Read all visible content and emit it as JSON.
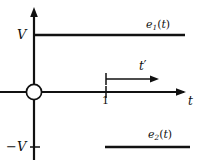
{
  "figure": {
    "background_color": "#ffffff",
    "stroke_color": "#111111",
    "width": 201,
    "height": 164
  },
  "axes": {
    "vertical": {
      "name": "voltage-axis",
      "x": 34,
      "top": 8,
      "bottom": 160,
      "arrow": "up"
    },
    "horizontal": {
      "name": "time-axis",
      "y": 92,
      "left": 0,
      "right": 186,
      "arrow": "right",
      "label": "t"
    },
    "origin": {
      "name": "origin-node",
      "x": 34,
      "y": 92,
      "radius": 8,
      "symbol": "crossed-circle"
    }
  },
  "ticks": [
    {
      "name": "tick-V",
      "label": "V",
      "axis": "vertical",
      "value_y": 35
    },
    {
      "name": "tick-neg-V",
      "label": "−V",
      "axis": "vertical",
      "value_y": 147
    },
    {
      "name": "tick-one",
      "label": "1",
      "axis": "horizontal",
      "value_x": 106
    }
  ],
  "signals": [
    {
      "name": "e1-trace",
      "label_text": "e",
      "label_sub": "1",
      "label_arg": "(t)",
      "level": "V",
      "y": 35,
      "x_start": 34,
      "x_end": 185
    },
    {
      "name": "e2-trace",
      "label_text": "e",
      "label_sub": "2",
      "label_arg": "(t)",
      "level": "-V",
      "y": 147,
      "x_start": 105,
      "x_end": 190
    }
  ],
  "annotation": {
    "name": "t-prime-arrow",
    "label": "t′",
    "y": 79,
    "x_start": 106,
    "x_end": 158,
    "arrow": "right",
    "start_tick": true
  },
  "labels": {
    "v": "V",
    "neg_v": "−V",
    "one": "1",
    "t": "t",
    "t_prime_base": "t",
    "t_prime_mark": "′",
    "e1_base": "e",
    "e1_sub": "1",
    "e1_arg": "(t)",
    "e2_base": "e",
    "e2_sub": "2",
    "e2_arg": "(t)"
  }
}
